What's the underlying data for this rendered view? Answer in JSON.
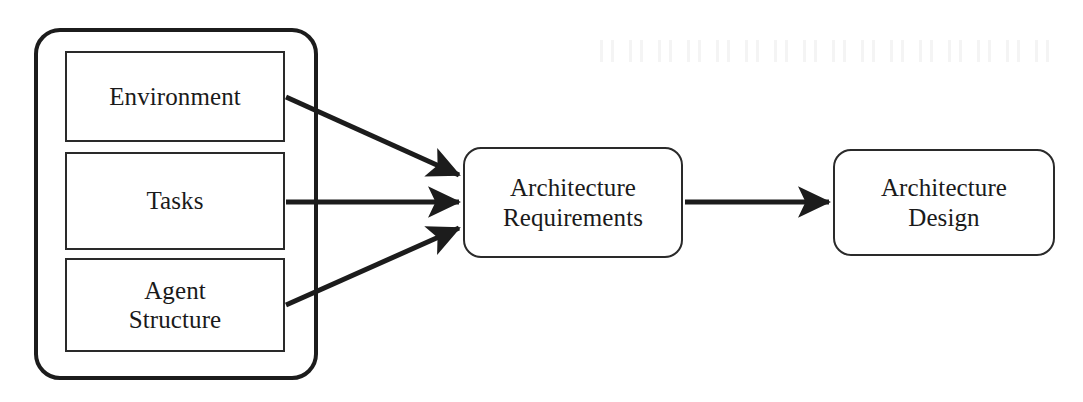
{
  "diagram": {
    "background_color": "#ffffff",
    "stroke_color": "#1c1c1c",
    "text_color": "#1a1a1a",
    "group": {
      "name": "inputs-group",
      "label": "",
      "border_style": "thick rounded rectangle"
    },
    "nodes": [
      {
        "id": "environment",
        "label": "Environment",
        "shape": "rectangle",
        "x": 65,
        "y": 51,
        "width": 220,
        "height": 91
      },
      {
        "id": "tasks",
        "label": "Tasks",
        "shape": "rectangle",
        "x": 65,
        "y": 152,
        "width": 220,
        "height": 98
      },
      {
        "id": "agent_structure",
        "label": "Agent\nStructure",
        "shape": "rectangle",
        "x": 65,
        "y": 258,
        "width": 220,
        "height": 94
      },
      {
        "id": "architecture_requirements",
        "label": "Architecture\nRequirements",
        "shape": "rounded-rectangle",
        "x": 463,
        "y": 147,
        "width": 220,
        "height": 111
      },
      {
        "id": "architecture_design",
        "label": "Architecture\nDesign",
        "shape": "rounded-rectangle",
        "x": 833,
        "y": 149,
        "width": 222,
        "height": 107
      }
    ],
    "edges": [
      {
        "id": "environment-to-requirements",
        "from": "environment",
        "to": "architecture_requirements",
        "label": "",
        "x1": 286,
        "y1": 97,
        "x2": 459,
        "y2": 175
      },
      {
        "id": "tasks-to-requirements",
        "from": "tasks",
        "to": "architecture_requirements",
        "label": "",
        "x1": 286,
        "y1": 202,
        "x2": 459,
        "y2": 202
      },
      {
        "id": "agent-structure-to-requirements",
        "from": "agent_structure",
        "to": "architecture_requirements",
        "label": "",
        "x1": 286,
        "y1": 305,
        "x2": 459,
        "y2": 228
      },
      {
        "id": "requirements-to-design",
        "from": "architecture_requirements",
        "to": "architecture_design",
        "label": "",
        "x1": 685,
        "y1": 202,
        "x2": 829,
        "y2": 202
      }
    ]
  }
}
